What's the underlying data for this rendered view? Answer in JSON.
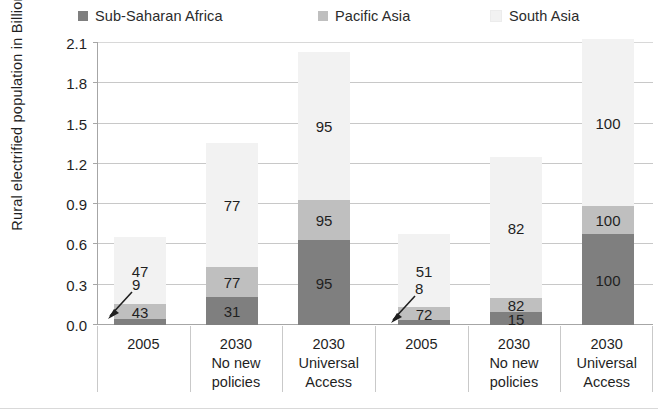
{
  "legend": {
    "entries": [
      {
        "label": "Sub-Saharan Africa",
        "color": "#7f7f7f",
        "key": "sub-saharan-africa"
      },
      {
        "label": "Pacific Asia",
        "color": "#bfbfbf",
        "key": "pacific-asia"
      },
      {
        "label": "South Asia",
        "color": "#f2f2f2",
        "key": "south-asia"
      }
    ]
  },
  "axes": {
    "y_title": "Rural electrified population in Billion",
    "y_ticks": [
      "0.0",
      "0.3",
      "0.6",
      "0.9",
      "1.2",
      "1.5",
      "1.8",
      "2.1"
    ],
    "x_categories": [
      {
        "l1": "2005",
        "l2": "",
        "l3": ""
      },
      {
        "l1": "2030",
        "l2": "No new",
        "l3": "policies"
      },
      {
        "l1": "2030",
        "l2": "Universal",
        "l3": "Access"
      },
      {
        "l1": "2005",
        "l2": "",
        "l3": ""
      },
      {
        "l1": "2030",
        "l2": "No new",
        "l3": "policies"
      },
      {
        "l1": "2030",
        "l2": "Universal",
        "l3": "Access"
      }
    ]
  },
  "chart_data": {
    "type": "bar",
    "title": "",
    "xlabel": "",
    "ylabel": "Rural electrified population in Billion",
    "ylim": [
      0.0,
      2.1
    ],
    "ytick_step": 0.3,
    "grid": true,
    "stacked": true,
    "legend_position": "top",
    "categories": [
      "2005",
      "2030 No new policies",
      "2030 Universal Access",
      "2005",
      "2030 No new policies",
      "2030 Universal Access"
    ],
    "series": [
      {
        "name": "Sub-Saharan Africa",
        "color": "#7f7f7f",
        "values": [
          0.04,
          0.21,
          0.63,
          0.03,
          0.09,
          0.68
        ],
        "labels": [
          "9",
          "31",
          "95",
          "8",
          "15",
          "100"
        ],
        "label_unit": "%"
      },
      {
        "name": "Pacific Asia",
        "color": "#bfbfbf",
        "values": [
          0.11,
          0.22,
          0.3,
          0.09,
          0.1,
          0.21
        ],
        "labels": [
          "43",
          "77",
          "95",
          "72",
          "82",
          "100"
        ],
        "label_unit": "%"
      },
      {
        "name": "South Asia",
        "color": "#f2f2f2",
        "values": [
          0.51,
          0.93,
          1.1,
          0.56,
          1.06,
          1.24
        ],
        "labels": [
          "47",
          "77",
          "95",
          "51",
          "82",
          "100"
        ],
        "label_unit": "%"
      }
    ],
    "totals": [
      0.66,
      1.36,
      2.03,
      0.68,
      1.25,
      2.13
    ],
    "annotations": [
      {
        "text": "9",
        "points_to_bar": 1,
        "points_to_series": "Sub-Saharan Africa"
      },
      {
        "text": "8",
        "points_to_bar": 4,
        "points_to_series": "Sub-Saharan Africa"
      }
    ],
    "note": "Segment labels are electrification rates in percent; bar segment heights are population in billions."
  },
  "bars": [
    {
      "key": "bar-2005-a",
      "left": 16,
      "width": 52,
      "segments": [
        {
          "series": "Sub-Saharan Africa",
          "height": 6,
          "label": "9",
          "show_label": false
        },
        {
          "series": "Pacific Asia",
          "height": 15,
          "label": "43",
          "show_label": true
        },
        {
          "series": "South Asia",
          "height": 67,
          "label": "47",
          "show_label": true
        }
      ]
    },
    {
      "key": "bar-2030-nonew-a",
      "left": 108,
      "width": 52,
      "segments": [
        {
          "series": "Sub-Saharan Africa",
          "height": 28,
          "label": "31",
          "show_label": true
        },
        {
          "series": "Pacific Asia",
          "height": 30,
          "label": "77",
          "show_label": true
        },
        {
          "series": "South Asia",
          "height": 124,
          "label": "77",
          "show_label": true
        }
      ]
    },
    {
      "key": "bar-2030-universal-a",
      "left": 200,
      "width": 52,
      "segments": [
        {
          "series": "Sub-Saharan Africa",
          "height": 85,
          "label": "95",
          "show_label": true
        },
        {
          "series": "Pacific Asia",
          "height": 40,
          "label": "95",
          "show_label": true
        },
        {
          "series": "South Asia",
          "height": 148,
          "label": "95",
          "show_label": true
        }
      ]
    },
    {
      "key": "bar-2005-b",
      "left": 300,
      "width": 52,
      "segments": [
        {
          "series": "Sub-Saharan Africa",
          "height": 5,
          "label": "8",
          "show_label": false
        },
        {
          "series": "Pacific Asia",
          "height": 13,
          "label": "72",
          "show_label": true
        },
        {
          "series": "South Asia",
          "height": 73,
          "label": "51",
          "show_label": true
        }
      ]
    },
    {
      "key": "bar-2030-nonew-b",
      "left": 392,
      "width": 52,
      "segments": [
        {
          "series": "Sub-Saharan Africa",
          "height": 13,
          "label": "15",
          "show_label": true
        },
        {
          "series": "Pacific Asia",
          "height": 14,
          "label": "82",
          "show_label": true
        },
        {
          "series": "South Asia",
          "height": 141,
          "label": "82",
          "show_label": true
        }
      ]
    },
    {
      "key": "bar-2030-universal-b",
      "left": 484,
      "width": 52,
      "segments": [
        {
          "series": "Sub-Saharan Africa",
          "height": 91,
          "label": "100",
          "show_label": true
        },
        {
          "series": "Pacific Asia",
          "height": 28,
          "label": "100",
          "show_label": true
        },
        {
          "series": "South Asia",
          "height": 167,
          "label": "100",
          "show_label": true
        }
      ]
    }
  ],
  "callouts": [
    {
      "key": "callout-9",
      "text": "9",
      "x": 102,
      "y": 282
    },
    {
      "key": "callout-8",
      "text": "8",
      "x": 385,
      "y": 286
    }
  ]
}
